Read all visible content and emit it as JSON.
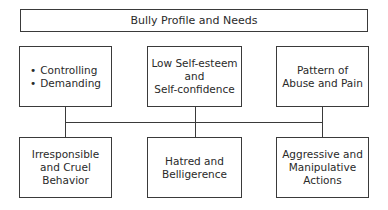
{
  "diagram": {
    "title": "Bully Profile and Needs",
    "top_row": [
      {
        "type": "bullets",
        "items": [
          "Controlling",
          "Demanding"
        ]
      },
      {
        "type": "text",
        "text": "Low Self-esteem\nand\nSelf-confidence"
      },
      {
        "type": "text",
        "text": "Pattern of\nAbuse and Pain"
      }
    ],
    "bottom_row": [
      {
        "text": "Irresponsible\nand Cruel\nBehavior"
      },
      {
        "text": "Hatred and\nBelligerence"
      },
      {
        "text": "Aggressive and\nManipulative\nActions"
      }
    ],
    "line_color": "#3a3a3a"
  }
}
